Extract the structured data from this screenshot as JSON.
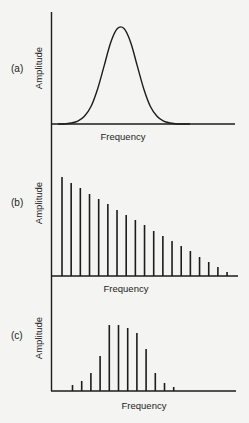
{
  "colors": {
    "ink": "#1c1c1c",
    "paper": "#f4f4f2"
  },
  "chart_data": [
    {
      "panel": "(a)",
      "type": "line",
      "title": "",
      "xlabel": "Frequency",
      "ylabel": "Amplitude",
      "description": "Continuous bell-shaped (Gaussian) spectrum",
      "x": [
        0,
        0.05,
        0.1,
        0.15,
        0.2,
        0.25,
        0.3,
        0.35,
        0.4,
        0.45,
        0.5,
        0.55,
        0.6,
        0.65,
        0.7,
        0.75,
        0.8,
        0.85,
        0.9,
        0.95,
        1.0
      ],
      "y": [
        0.0,
        0.0,
        0.01,
        0.03,
        0.08,
        0.18,
        0.36,
        0.6,
        0.84,
        0.98,
        0.98,
        0.84,
        0.6,
        0.36,
        0.18,
        0.08,
        0.03,
        0.01,
        0.0,
        0.0,
        0.0
      ],
      "xlim": [
        0,
        1
      ],
      "ylim": [
        0,
        1.15
      ],
      "grid": false,
      "ticks": false
    },
    {
      "panel": "(b)",
      "type": "bar",
      "title": "",
      "xlabel": "Frequency",
      "ylabel": "Amplitude",
      "description": "Line spectrum with linearly decreasing harmonic amplitudes",
      "harmonics": [
        1,
        2,
        3,
        4,
        5,
        6,
        7,
        8,
        9,
        10,
        11,
        12,
        13,
        14,
        15,
        16,
        17,
        18,
        19
      ],
      "values": [
        99,
        93,
        88,
        82,
        77,
        72,
        66,
        61,
        56,
        51,
        45,
        40,
        35,
        30,
        25,
        19,
        14,
        9,
        4
      ],
      "ylim": [
        0,
        110
      ],
      "grid": false,
      "ticks": false
    },
    {
      "panel": "(c)",
      "type": "bar",
      "title": "",
      "xlabel": "Frequency",
      "ylabel": "Amplitude",
      "description": "Line spectrum with bell-shaped envelope of harmonic amplitudes",
      "harmonics": [
        1,
        2,
        3,
        4,
        5,
        6,
        7,
        8,
        9,
        10,
        11,
        12
      ],
      "values": [
        6,
        10,
        18,
        35,
        66,
        66,
        63,
        58,
        42,
        18,
        8,
        4
      ],
      "ylim": [
        0,
        75
      ],
      "grid": false,
      "ticks": false
    }
  ]
}
